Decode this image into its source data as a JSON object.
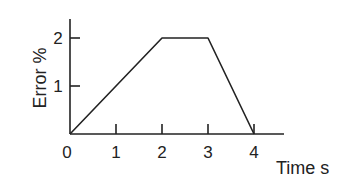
{
  "chart_data": {
    "type": "line",
    "title": "",
    "xlabel": "Time s",
    "ylabel": "Error %",
    "x": [
      0,
      2,
      3,
      4
    ],
    "series": [
      {
        "name": "Error",
        "values": [
          0,
          2,
          2,
          0
        ]
      }
    ],
    "x_ticks": [
      "0",
      "1",
      "2",
      "3",
      "4"
    ],
    "y_ticks": [
      "1",
      "2"
    ],
    "xlim": [
      0,
      4.7
    ],
    "ylim": [
      0,
      2.4
    ],
    "grid": false,
    "legend": "none",
    "line_color": "#222222"
  }
}
